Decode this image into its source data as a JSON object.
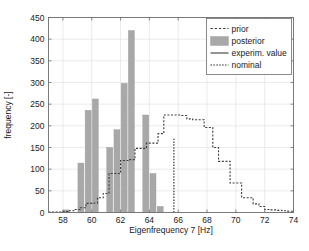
{
  "chart_data": {
    "type": "bar",
    "title": "",
    "xlabel": "Eigenfrequency 7 [Hz]",
    "ylabel": "frequency [-]",
    "xlim": [
      57.0,
      74.0
    ],
    "ylim": [
      0,
      450
    ],
    "xticks": [
      58,
      60,
      62,
      64,
      66,
      68,
      70,
      72,
      74
    ],
    "yticks": [
      0,
      50,
      100,
      150,
      200,
      250,
      300,
      350,
      400,
      450
    ],
    "grid": true,
    "legend_position": "top-right",
    "legend": [
      {
        "label": "prior",
        "style": "dashed-line",
        "color": "#3c3c3c"
      },
      {
        "label": "posterior",
        "style": "filled-bar",
        "color": "#a8a8a8"
      },
      {
        "label": "experim. value",
        "style": "solid-line",
        "color": "#3c3c3c"
      },
      {
        "label": "nominal",
        "style": "dotted-line",
        "color": "#2b2b2b"
      }
    ],
    "series": [
      {
        "name": "posterior",
        "type": "bar",
        "bin_width": 0.5,
        "bins_left": [
          57.0,
          57.5,
          58.0,
          58.5,
          59.0,
          59.5,
          60.0,
          60.5,
          61.0,
          61.5,
          62.0,
          62.5,
          63.0,
          63.5,
          64.0,
          64.5,
          65.0
        ],
        "values": [
          0,
          0,
          6,
          0,
          114,
          236,
          262,
          0,
          150,
          191,
          298,
          420,
          0,
          225,
          90,
          14,
          0
        ]
      },
      {
        "name": "prior",
        "type": "line",
        "x": [
          57.0,
          57.5,
          58.0,
          58.4,
          58.8,
          59.2,
          59.6,
          60.0,
          60.4,
          60.8,
          61.0,
          61.2,
          61.6,
          62.0,
          62.2,
          62.6,
          63.0,
          63.4,
          63.8,
          64.2,
          64.6,
          65.0,
          65.6,
          66.2,
          66.6,
          67.0,
          67.4,
          67.8,
          68.0,
          68.4,
          68.8,
          69.2,
          69.6,
          70.0,
          70.4,
          70.8,
          71.2,
          71.6,
          72.0,
          72.4,
          72.8,
          73.2,
          73.6,
          74.0
        ],
        "values": [
          1,
          1,
          2,
          4,
          7,
          11,
          21,
          22,
          34,
          44,
          44,
          90,
          90,
          120,
          120,
          122,
          148,
          148,
          160,
          160,
          182,
          225,
          225,
          224,
          216,
          214,
          214,
          196,
          196,
          150,
          118,
          118,
          68,
          68,
          34,
          34,
          20,
          14,
          7,
          6,
          5,
          4,
          3,
          2
        ]
      },
      {
        "name": "nominal",
        "type": "vline",
        "x": 65.7,
        "y_top": 170
      },
      {
        "name": "experim. value",
        "type": "vline-solid",
        "x": null,
        "y_top": null
      }
    ]
  }
}
